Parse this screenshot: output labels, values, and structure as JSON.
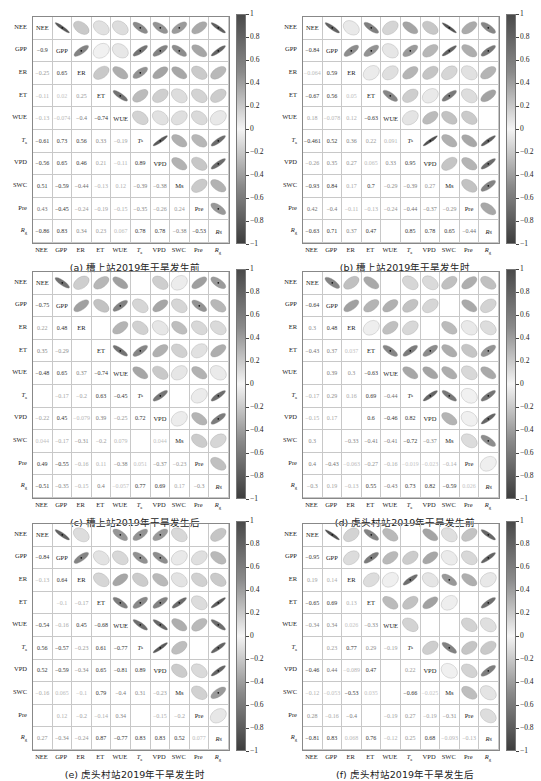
{
  "chart_data": [
    {
      "id": "a",
      "type": "heatmap",
      "subtype": "correlation-ellipse-matrix",
      "caption": "(a) 槽上站2019年干旱发生前",
      "variables": [
        "NEE",
        "GPP",
        "ER",
        "ET",
        "WUE",
        "Ta",
        "VPD",
        "SWC",
        "Pre",
        "Rg"
      ],
      "diag_labels": [
        "NEE",
        "GPP",
        "ER",
        "ET",
        "WUE",
        "Ta",
        "VPD",
        "Ms",
        "Pre",
        "Rg"
      ],
      "lower": [
        [],
        [
          -0.9
        ],
        [
          -0.25,
          0.65
        ],
        [
          -0.11,
          0.02,
          0.25
        ],
        [
          -0.13,
          -0.074,
          -0.4,
          -0.74
        ],
        [
          -0.61,
          0.73,
          0.56,
          0.33,
          -0.19
        ],
        [
          -0.56,
          0.65,
          0.46,
          0.21,
          -0.11,
          0.89
        ],
        [
          0.51,
          -0.59,
          -0.44,
          -0.13,
          0.12,
          -0.39,
          -0.38
        ],
        [
          0.43,
          -0.45,
          -0.24,
          -0.19,
          -0.15,
          -0.35,
          -0.26,
          0.24
        ],
        [
          -0.86,
          0.83,
          0.34,
          0.23,
          0.067,
          0.78,
          0.78,
          -0.38,
          -0.53
        ]
      ],
      "colorbar": {
        "ticks": [
          "1",
          "0.8",
          "0.6",
          "0.4",
          "0.2",
          "0",
          "-0.2",
          "-0.4",
          "-0.6",
          "-0.8",
          "-1"
        ],
        "range": [
          -1,
          1
        ]
      }
    },
    {
      "id": "b",
      "type": "heatmap",
      "subtype": "correlation-ellipse-matrix",
      "caption": "(b) 槽上站2019年干旱发生时",
      "variables": [
        "NEE",
        "GPP",
        "ER",
        "ET",
        "WUE",
        "Ta",
        "VPD",
        "SWC",
        "Pre",
        "Rg"
      ],
      "diag_labels": [
        "NEE",
        "GPP",
        "ER",
        "ET",
        "WUE",
        "Ta",
        "VPD",
        "Ms",
        "Pre",
        "Rg"
      ],
      "lower": [
        [],
        [
          -0.84
        ],
        [
          -0.064,
          0.59
        ],
        [
          -0.67,
          0.56,
          0.05
        ],
        [
          0.18,
          -0.078,
          0.12,
          -0.63
        ],
        [
          -0.461,
          0.52,
          0.36,
          0.22,
          0.091
        ],
        [
          -0.26,
          0.35,
          0.27,
          0.065,
          0.33,
          0.95
        ],
        [
          -0.93,
          0.84,
          0.17,
          0.7,
          -0.29,
          -0.39,
          0.27
        ],
        [
          0.42,
          -0.4,
          -0.11,
          -0.13,
          -0.24,
          -0.44,
          -0.37,
          -0.29
        ],
        [
          -0.63,
          0.71,
          0.37,
          0.47,
          null,
          0.85,
          0.78,
          0.65,
          -0.44
        ]
      ],
      "colorbar": {
        "ticks": [
          "1",
          "0.8",
          "0.6",
          "0.4",
          "0.2",
          "0",
          "-0.2",
          "-0.4",
          "-0.6",
          "-0.8",
          "-1"
        ],
        "range": [
          -1,
          1
        ]
      }
    },
    {
      "id": "c",
      "type": "heatmap",
      "subtype": "correlation-ellipse-matrix",
      "caption": "(c) 槽上站2019年干旱发生后",
      "variables": [
        "NEE",
        "GPP",
        "ER",
        "ET",
        "WUE",
        "Ta",
        "VPD",
        "SWC",
        "Pre",
        "Rg"
      ],
      "diag_labels": [
        "NEE",
        "GPP",
        "ER",
        "ET",
        "WUE",
        "Ta",
        "VPD",
        "Ms",
        "Pre",
        "Rg"
      ],
      "lower": [
        [],
        [
          -0.75
        ],
        [
          0.22,
          0.48
        ],
        [
          0.35,
          -0.29,
          null
        ],
        [
          -0.48,
          0.65,
          0.37,
          -0.74
        ],
        [
          null,
          -0.17,
          -0.2,
          0.63,
          -0.45
        ],
        [
          -0.22,
          0.45,
          -0.079,
          0.39,
          -0.25,
          0.72
        ],
        [
          0.044,
          -0.17,
          -0.31,
          -0.2,
          0.079,
          null,
          0.044
        ],
        [
          0.49,
          -0.55,
          -0.16,
          0.11,
          -0.38,
          0.051,
          -0.37,
          -0.23
        ],
        [
          -0.51,
          -0.35,
          -0.15,
          0.4,
          -0.057,
          0.77,
          0.69,
          0.17,
          -0.3
        ]
      ],
      "colorbar": {
        "ticks": [
          "1",
          "0.8",
          "0.6",
          "0.4",
          "0.2",
          "0",
          "-0.2",
          "-0.4",
          "-0.6",
          "-0.8",
          "-1"
        ],
        "range": [
          -1,
          1
        ]
      }
    },
    {
      "id": "d",
      "type": "heatmap",
      "subtype": "correlation-ellipse-matrix",
      "caption": "(d) 虎头村站2019年干旱发生前",
      "variables": [
        "NEE",
        "GPP",
        "ER",
        "ET",
        "WUE",
        "Ta",
        "VPD",
        "SWC",
        "Pre",
        "Rg"
      ],
      "diag_labels": [
        "NEE",
        "GPP",
        "ER",
        "ET",
        "WUE",
        "Ta",
        "VPD",
        "Ms",
        "Pre",
        "Rg"
      ],
      "lower": [
        [],
        [
          -0.64
        ],
        [
          0.3,
          0.48
        ],
        [
          -0.43,
          0.37,
          0.037
        ],
        [
          null,
          0.39,
          0.3,
          -0.63
        ],
        [
          -0.17,
          0.29,
          0.16,
          0.69,
          -0.44
        ],
        [
          -0.15,
          0.17,
          null,
          0.6,
          -0.46,
          0.82
        ],
        [
          0.3,
          null,
          -0.33,
          -0.41,
          -0.41,
          -0.72,
          -0.37
        ],
        [
          0.4,
          -0.43,
          -0.063,
          -0.27,
          -0.16,
          -0.019,
          -0.023,
          -0.14
        ],
        [
          -0.3,
          0.19,
          -0.13,
          0.55,
          -0.43,
          0.73,
          0.82,
          -0.59,
          0.026
        ]
      ],
      "colorbar": {
        "ticks": [
          "1",
          "0.8",
          "0.6",
          "0.4",
          "0.2",
          "0",
          "-0.2",
          "-0.4",
          "-0.6",
          "-0.8",
          "-1"
        ],
        "range": [
          -1,
          1
        ]
      }
    },
    {
      "id": "e",
      "type": "heatmap",
      "subtype": "correlation-ellipse-matrix",
      "caption": "(e) 虎头村站2019年干旱发生时",
      "variables": [
        "NEE",
        "GPP",
        "ER",
        "ET",
        "WUE",
        "Ta",
        "VPD",
        "SWC",
        "Pre",
        "Rg"
      ],
      "diag_labels": [
        "NEE",
        "GPP",
        "ER",
        "ET",
        "WUE",
        "Ta",
        "VPD",
        "Ms",
        "Pre",
        "Rg"
      ],
      "lower": [
        [],
        [
          -0.84
        ],
        [
          -0.13,
          0.64
        ],
        [
          null,
          -0.1,
          -0.17
        ],
        [
          -0.54,
          -0.16,
          0.45,
          -0.68
        ],
        [
          0.56,
          -0.57,
          -0.23,
          0.61,
          -0.77
        ],
        [
          0.52,
          -0.59,
          -0.34,
          0.65,
          -0.81,
          0.89
        ],
        [
          -0.16,
          0.065,
          -0.1,
          0.79,
          -0.4,
          0.31,
          -0.23
        ],
        [
          null,
          0.12,
          -0.2,
          -0.14,
          0.34,
          null,
          -0.15,
          -0.2
        ],
        [
          0.27,
          -0.34,
          -0.24,
          0.87,
          -0.77,
          0.83,
          0.83,
          0.52,
          0.077
        ]
      ],
      "colorbar": {
        "ticks": [
          "1",
          "0.8",
          "0.6",
          "0.4",
          "0.2",
          "0",
          "-0.2",
          "-0.4",
          "-0.6",
          "-0.8",
          "-1"
        ],
        "range": [
          -1,
          1
        ]
      }
    },
    {
      "id": "f",
      "type": "heatmap",
      "subtype": "correlation-ellipse-matrix",
      "caption": "(f) 虎头村站2019年干旱发生后",
      "variables": [
        "NEE",
        "GPP",
        "ER",
        "ET",
        "WUE",
        "Ta",
        "VPD",
        "SWC",
        "Pre",
        "Rg"
      ],
      "diag_labels": [
        "NEE",
        "GPP",
        "ER",
        "ET",
        "WUE",
        "Ta",
        "VPD",
        "Ms",
        "Pre",
        "Rg"
      ],
      "lower": [
        [],
        [
          -0.95
        ],
        [
          0.19,
          0.14
        ],
        [
          -0.65,
          0.69,
          0.13
        ],
        [
          -0.34,
          0.34,
          0.026,
          -0.33
        ],
        [
          null,
          0.23,
          0.77,
          0.29,
          -0.19
        ],
        [
          -0.46,
          0.44,
          -0.089,
          0.47,
          null,
          0.22
        ],
        [
          -0.12,
          -0.053,
          -0.53,
          0.035,
          null,
          -0.66,
          -0.025
        ],
        [
          0.28,
          -0.16,
          -0.4,
          null,
          -0.19,
          0.27,
          -0.19,
          -0.31
        ],
        [
          -0.81,
          0.83,
          0.068,
          0.76,
          -0.12,
          0.25,
          0.68,
          -0.093,
          -0.13
        ]
      ],
      "colorbar": {
        "ticks": [
          "1",
          "0.8",
          "0.6",
          "0.4",
          "0.2",
          "0",
          "-0.2",
          "-0.4",
          "-0.6",
          "-0.8",
          "-1"
        ],
        "range": [
          -1,
          1
        ]
      }
    }
  ],
  "axis_labels": {
    "rows": [
      "NEE",
      "GPP",
      "ER",
      "ET",
      "WUE",
      "Ta",
      "VPD",
      "SWC",
      "Pre",
      "Rg"
    ],
    "cols": [
      "NEE",
      "GPP",
      "ER",
      "ET",
      "WUE",
      "Ta",
      "VPD",
      "SWC",
      "Pre",
      "Rg"
    ]
  },
  "colors": {
    "strong": "#4a4a4a",
    "mid": "#8a8a8a",
    "zero": "#f4f4f4",
    "grid": "#c8c8c8",
    "border": "#888888"
  }
}
